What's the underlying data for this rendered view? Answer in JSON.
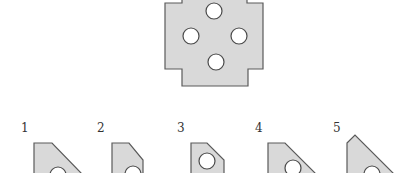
{
  "puzzle": {
    "reference_shape": {
      "description": "square plate with stepped notches and four circular holes",
      "holes": 4
    },
    "options": [
      {
        "label": "1"
      },
      {
        "label": "2"
      },
      {
        "label": "3"
      },
      {
        "label": "4"
      },
      {
        "label": "5"
      }
    ]
  }
}
